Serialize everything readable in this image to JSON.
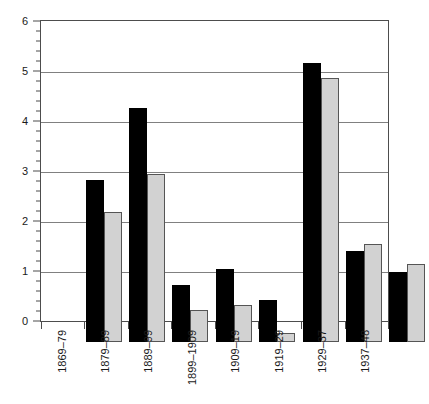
{
  "chart_data": {
    "type": "bar",
    "title": "",
    "subtitle": "",
    "xlabel": "",
    "ylabel": "",
    "categories": [
      "1869–79",
      "1879–89",
      "1889–99",
      "1899–1909",
      "1909–19",
      "1919–29",
      "1929–37",
      "1937–48"
    ],
    "series": [
      {
        "name": "series-a",
        "color": "#000000",
        "values": [
          3.24,
          4.68,
          1.14,
          1.46,
          0.84,
          5.58,
          1.82,
          1.4
        ]
      },
      {
        "name": "series-b",
        "color": "#d2d2d2",
        "values": [
          2.6,
          3.36,
          0.64,
          0.74,
          0.18,
          5.28,
          1.96,
          1.57
        ]
      }
    ],
    "ylim": [
      0,
      6
    ],
    "xlim_categories": 8,
    "y_ticks": [
      0,
      1,
      2,
      3,
      4,
      5,
      6
    ],
    "y_tick_labels": [
      "0",
      "1",
      "2",
      "3",
      "4",
      "5",
      "6"
    ],
    "y_minor_tick_step": 0.2,
    "grid": "horizontal",
    "legend": "none",
    "legend_position": "none",
    "annotations": []
  },
  "axes": {
    "frame_color": "#4d4d4d",
    "gridline_color": "#808080",
    "background": "#ffffff"
  }
}
